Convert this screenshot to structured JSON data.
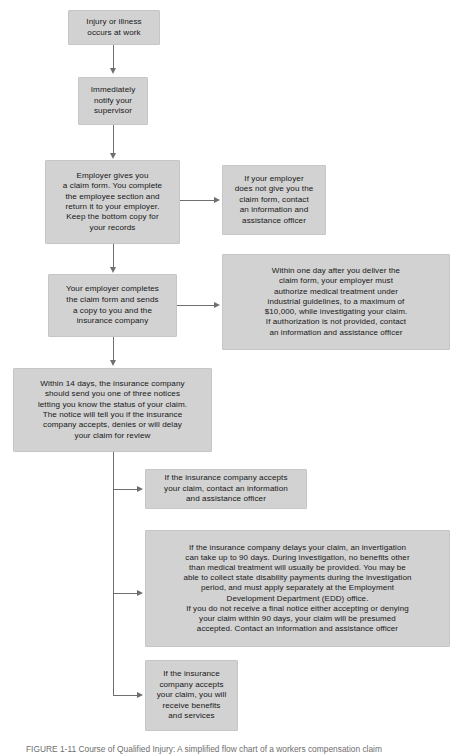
{
  "figure": {
    "caption": "FIGURE 1-11    Course of Qualified Injury: A simplified flow chart of a workers compensation claim",
    "box_fill": "#d2d2d2",
    "line_color": "#6f6f6f",
    "text_color": "#171717",
    "background": "#ffffff"
  },
  "nodes": {
    "injury": "Injury or illness\noccurs at work",
    "notify": "Immediately\nnotify your\nsupervisor",
    "claim_form": "Employer gives you\na claim form. You complete\nthe employee section and\nreturn it to your employer.\nKeep the bottom copy for\nyour records",
    "no_form": "If your employer\ndoes not give you the\nclaim form, contact\nan information and\nassistance officer",
    "employer_completes": "Your employer completes\nthe claim form and sends\na copy to you and the\ninsurance company",
    "one_day": "Within one day after you deliver the\nclaim form, your employer must\nauthorize medical treatment under\nindustrial guidelines, to a maximum of\n$10,000, while investigating your claim.\nIf authorization is not provided, contact\nan information and assistance officer",
    "fourteen_days": "Within 14 days, the insurance company\nshould send you one of three notices\nletting you know the status of your claim.\nThe notice will tell you if the insurance\ncompany accepts, denies or will delay\nyour claim for review",
    "accepts_contact": "If the insurance company accepts\nyour claim, contact an information\nand assistance officer",
    "delays": "If the insurance company delays your claim, an invertigation\ncan take up to 90 days. During investigation, no benefits other\nthan medical treatment will usually be provided. You may be\nable to collect state disability payments during the investigation\nperiod, and must apply separately at the Employment\nDevelopment Department (EDD) office.\nIf you do not receive a final notice either accepting or denying\nyour claim within 90 days, your claim will be presumed\naccepted. Contact an information and assistance officer",
    "accepts_benefits": "If the insurance\ncompany accepts\nyour claim, you will\nreceive benefits\nand services"
  }
}
